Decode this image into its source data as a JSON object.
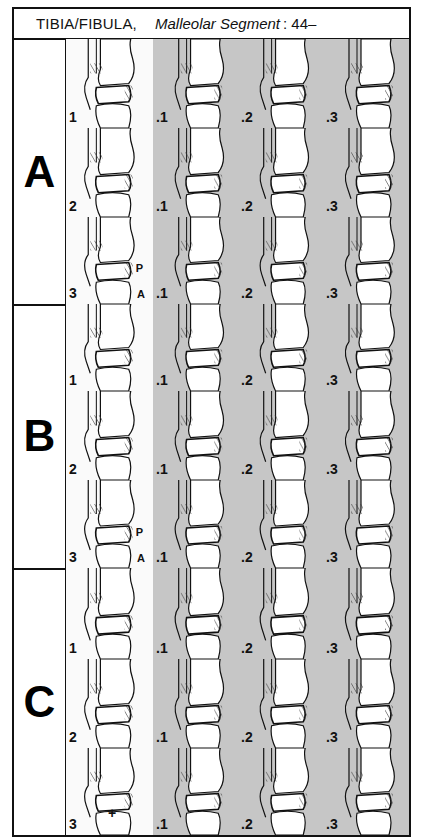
{
  "header": {
    "bone": "TIBIA/FIBULA,",
    "segment_label": "Malleolar Segment",
    "code": ": 44–"
  },
  "colors": {
    "border": "#111111",
    "shaded_cell": "#c6c6c6",
    "plain_cell": "#fafafa"
  },
  "groups": [
    {
      "letter": "A",
      "rows": [
        {
          "group_label": "1",
          "subgroups": [
            ".1",
            ".2",
            ".3"
          ],
          "markers": []
        },
        {
          "group_label": "2",
          "subgroups": [
            ".1",
            ".2",
            ".3"
          ],
          "markers": []
        },
        {
          "group_label": "3",
          "subgroups": [
            ".1",
            ".2",
            ".3"
          ],
          "markers": [
            "P",
            "A"
          ]
        }
      ]
    },
    {
      "letter": "B",
      "rows": [
        {
          "group_label": "1",
          "subgroups": [
            ".1",
            ".2",
            ".3"
          ],
          "markers": []
        },
        {
          "group_label": "2",
          "subgroups": [
            ".1",
            ".2",
            ".3"
          ],
          "markers": []
        },
        {
          "group_label": "3",
          "subgroups": [
            ".1",
            ".2",
            ".3"
          ],
          "markers": [
            "P",
            "A"
          ]
        }
      ]
    },
    {
      "letter": "C",
      "rows": [
        {
          "group_label": "1",
          "subgroups": [
            ".1",
            ".2",
            ".3"
          ],
          "markers": []
        },
        {
          "group_label": "2",
          "subgroups": [
            ".1",
            ".2",
            ".3"
          ],
          "markers": []
        },
        {
          "group_label": "3",
          "subgroups": [
            ".1",
            ".2",
            ".3"
          ],
          "markers": [
            "+"
          ]
        }
      ]
    }
  ]
}
